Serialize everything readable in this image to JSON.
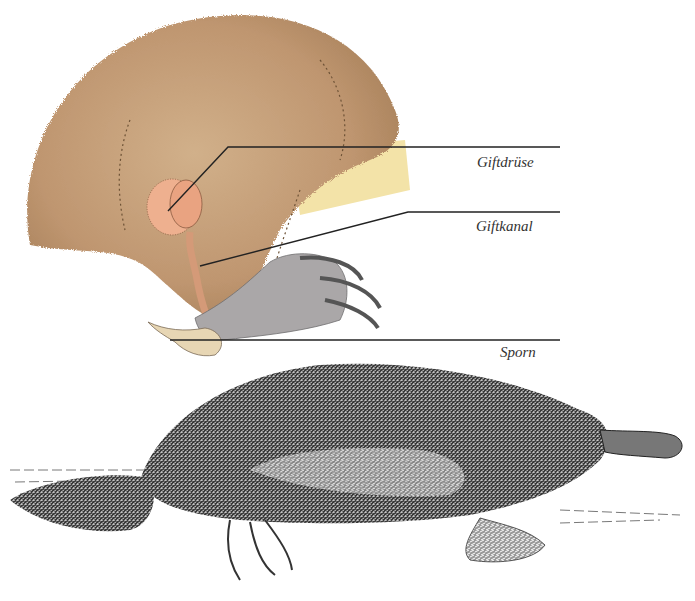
{
  "figure": {
    "labels": [
      {
        "id": "gland",
        "text": "Giftdrüse"
      },
      {
        "id": "duct",
        "text": "Giftkanal"
      },
      {
        "id": "spur",
        "text": "Sporn"
      }
    ],
    "colors": {
      "fur": "#c09a72",
      "fur_dark": "#8c6a48",
      "belly": "#f3e3a8",
      "gland": "#eeb08f",
      "foot": "#a9a6a6",
      "spur": "#e7d6b4",
      "leader_line": "#222222",
      "platypus": "#2a2a2a"
    }
  }
}
